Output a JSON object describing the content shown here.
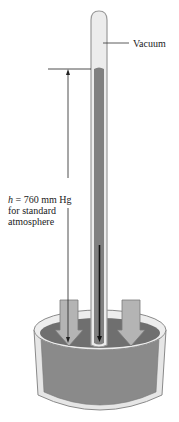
{
  "figure": {
    "labels": {
      "vacuum": "Vacuum",
      "height_var": "h",
      "height_value": " = 760 mm Hg",
      "height_line2": "for standard",
      "height_line3": "atmosphere"
    },
    "colors": {
      "mercury": "#808080",
      "mercury_dark": "#6e6e6e",
      "glass": "#e8e8e8",
      "glass_outline": "#9a9a9a",
      "arrow_fill": "#b4b4b4",
      "arrow_outline": "#7a7a7a",
      "line": "#222222"
    }
  }
}
